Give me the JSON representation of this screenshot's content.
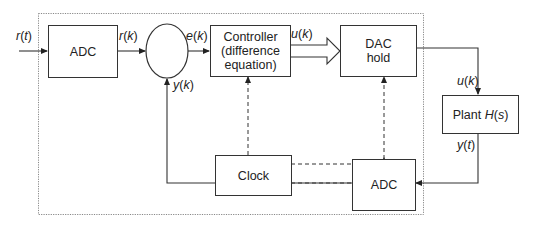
{
  "diagram": {
    "blocks": {
      "adc_input": {
        "label": "ADC"
      },
      "controller": {
        "line1": "Controller",
        "line2": "(difference",
        "line3": "equation)"
      },
      "dac_hold": {
        "line1": "DAC",
        "line2": "hold"
      },
      "clock": {
        "label": "Clock"
      },
      "plant": {
        "text": "Plant ",
        "func": "H",
        "arg_open": "(",
        "arg": "s",
        "arg_close": ")"
      },
      "adc_feedback": {
        "label": "ADC"
      }
    },
    "signals": {
      "r_t": {
        "var": "r",
        "arg": "t"
      },
      "r_k": {
        "var": "r",
        "arg": "k"
      },
      "e_k": {
        "var": "e",
        "arg": "k"
      },
      "u_k_controller": {
        "var": "u",
        "arg": "k"
      },
      "u_k_plant": {
        "var": "u",
        "arg": "k"
      },
      "y_k": {
        "var": "y",
        "arg": "k"
      },
      "y_t": {
        "var": "y",
        "arg": "t"
      }
    },
    "summing_junction": {
      "label": ""
    },
    "boundary": {
      "style": "dotted",
      "meaning": "digital computer"
    },
    "colors": {
      "line": "#333333",
      "frame": "#888888",
      "background": "#ffffff"
    }
  }
}
